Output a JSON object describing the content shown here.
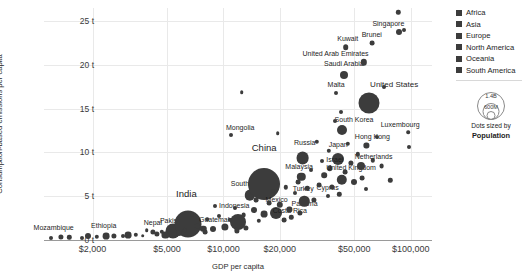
{
  "chart_data": {
    "type": "scatter",
    "title": "",
    "xlabel": "GDP per capita",
    "ylabel": "Consumption-based emissions per capita",
    "xscale": "log",
    "xlim": [
      1100,
      130000
    ],
    "ylim": [
      0,
      26.5
    ],
    "grid": true,
    "xticks": [
      {
        "value": 2000,
        "label": "$2,000"
      },
      {
        "value": 5000,
        "label": "$5,000"
      },
      {
        "value": 10000,
        "label": "$10,000"
      },
      {
        "value": 20000,
        "label": "$20,000"
      },
      {
        "value": 50000,
        "label": "$50,000"
      },
      {
        "value": 100000,
        "label": "$100,000"
      }
    ],
    "yticks": [
      {
        "value": 0,
        "label": "0 t"
      },
      {
        "value": 5,
        "label": "5 t"
      },
      {
        "value": 10,
        "label": "10 t"
      },
      {
        "value": 15,
        "label": "15 t"
      },
      {
        "value": 20,
        "label": "20 t"
      },
      {
        "value": 25,
        "label": "25 t"
      }
    ],
    "size_encoding": "Population",
    "legend_position": "right",
    "legend": {
      "title": "",
      "entries": [
        {
          "label": "Africa",
          "color": "#3c3c3c"
        },
        {
          "label": "Asia",
          "color": "#3c3c3c"
        },
        {
          "label": "Europe",
          "color": "#3c3c3c"
        },
        {
          "label": "North America",
          "color": "#3c3c3c"
        },
        {
          "label": "Oceania",
          "color": "#3c3c3c"
        },
        {
          "label": "South America",
          "color": "#3c3c3c"
        }
      ]
    },
    "size_legend": {
      "caption_line1": "Dots sized by",
      "caption_line2": "Population",
      "bubbles": [
        {
          "label": "1.4B",
          "diameter": 26
        },
        {
          "label": "600M",
          "diameter": 15
        },
        {
          "label": "",
          "diameter": 7
        }
      ]
    },
    "points": [
      {
        "name": "Mozambique",
        "x": 1350,
        "y": 0.35,
        "r": 2.6,
        "label": true,
        "lx": -7,
        "ly": -7
      },
      {
        "name": "Ethiopia",
        "x": 2350,
        "y": 0.45,
        "r": 3.4,
        "label": true,
        "lx": -2,
        "ly": -8
      },
      {
        "name": "Nepal",
        "x": 4200,
        "y": 0.9,
        "r": 2.6,
        "label": true,
        "lx": 0,
        "ly": -8
      },
      {
        "name": "Pakistan",
        "x": 5400,
        "y": 1.0,
        "r": 7.5,
        "label": true,
        "lx": 0,
        "ly": -4
      },
      {
        "name": "India",
        "x": 6500,
        "y": 1.85,
        "r": 13.5,
        "label": true,
        "lx": -2,
        "ly": -17,
        "size": "big"
      },
      {
        "name": "Guatemala",
        "x": 8800,
        "y": 1.25,
        "r": 3.0,
        "label": true,
        "lx": 3,
        "ly": -7
      },
      {
        "name": "Indonesia",
        "x": 12000,
        "y": 2.0,
        "r": 8.0,
        "label": true,
        "lx": -4,
        "ly": -9
      },
      {
        "name": "South Africa",
        "x": 13800,
        "y": 5.1,
        "r": 5.2,
        "label": true,
        "lx": 0,
        "ly": -7
      },
      {
        "name": "China",
        "x": 16500,
        "y": 6.4,
        "r": 16.0,
        "label": true,
        "lx": 0,
        "ly": -21,
        "size": "big"
      },
      {
        "name": "Mexico",
        "x": 19000,
        "y": 3.1,
        "r": 6.0,
        "label": true,
        "lx": 1,
        "ly": -8
      },
      {
        "name": "Costa Rica",
        "x": 21000,
        "y": 2.3,
        "r": 2.4,
        "label": true,
        "lx": 6,
        "ly": -7
      },
      {
        "name": "Panama",
        "x": 25500,
        "y": 3.1,
        "r": 2.6,
        "label": true,
        "lx": 5,
        "ly": -7
      },
      {
        "name": "Turkey",
        "x": 27000,
        "y": 4.4,
        "r": 5.2,
        "label": true,
        "lx": -1,
        "ly": -8
      },
      {
        "name": "Malaysia",
        "x": 26000,
        "y": 7.2,
        "r": 4.2,
        "label": true,
        "lx": -2,
        "ly": -7
      },
      {
        "name": "Russia",
        "x": 26500,
        "y": 9.4,
        "r": 6.4,
        "label": true,
        "lx": 2,
        "ly": -9
      },
      {
        "name": "Mongolia",
        "x": 11000,
        "y": 12.0,
        "r": 2.0,
        "label": true,
        "lx": 9,
        "ly": -6
      },
      {
        "name": "Japan",
        "x": 41000,
        "y": 9.3,
        "r": 6.0,
        "label": true,
        "lx": 0,
        "ly": -9
      },
      {
        "name": "Israel",
        "x": 37000,
        "y": 8.2,
        "r": 2.8,
        "label": true,
        "lx": 5,
        "ly": -6
      },
      {
        "name": "Cyprus",
        "x": 36000,
        "y": 5.0,
        "r": 2.0,
        "label": true,
        "lx": 0,
        "ly": -7
      },
      {
        "name": "United Kingdom",
        "x": 43000,
        "y": 6.9,
        "r": 5.2,
        "label": true,
        "lx": 9,
        "ly": -7
      },
      {
        "name": "Netherlands",
        "x": 54000,
        "y": 8.5,
        "r": 4.0,
        "label": true,
        "lx": 13,
        "ly": -6
      },
      {
        "name": "Hong Kong",
        "x": 58000,
        "y": 10.8,
        "r": 2.6,
        "label": true,
        "lx": 6,
        "ly": -7
      },
      {
        "name": "South Korea",
        "x": 43000,
        "y": 12.6,
        "r": 5.0,
        "label": true,
        "lx": 12,
        "ly": -6
      },
      {
        "name": "Luxembourg",
        "x": 97000,
        "y": 12.3,
        "r": 1.8,
        "label": true,
        "lx": -8,
        "ly": -7
      },
      {
        "name": "United States",
        "x": 60000,
        "y": 15.7,
        "r": 10.5,
        "label": true,
        "lx": 25,
        "ly": -8,
        "size": "mid"
      },
      {
        "name": "Malta",
        "x": 40000,
        "y": 16.8,
        "r": 2.0,
        "label": true,
        "lx": 0,
        "ly": -7
      },
      {
        "name": "Saudi Arabia",
        "x": 44000,
        "y": 18.9,
        "r": 4.0,
        "label": true,
        "lx": 0,
        "ly": -8
      },
      {
        "name": "United Arab Emirates",
        "x": 56000,
        "y": 20.3,
        "r": 3.2,
        "label": true,
        "lx": -28,
        "ly": -6
      },
      {
        "name": "Kuwait",
        "x": 45000,
        "y": 22.0,
        "r": 2.8,
        "label": true,
        "lx": 2,
        "ly": -7
      },
      {
        "name": "Brunei",
        "x": 62000,
        "y": 22.5,
        "r": 2.4,
        "label": true,
        "lx": 0,
        "ly": -7
      },
      {
        "name": "Singapore",
        "x": 87000,
        "y": 23.8,
        "r": 3.0,
        "label": true,
        "lx": -11,
        "ly": -6
      },
      {
        "name": "",
        "x": 1200,
        "y": 0.25,
        "r": 2.0,
        "label": false
      },
      {
        "name": "",
        "x": 1500,
        "y": 0.3,
        "r": 2.2,
        "label": false
      },
      {
        "name": "",
        "x": 1750,
        "y": 0.25,
        "r": 2.0,
        "label": false
      },
      {
        "name": "",
        "x": 1900,
        "y": 0.4,
        "r": 3.0,
        "label": false
      },
      {
        "name": "",
        "x": 2100,
        "y": 0.35,
        "r": 2.2,
        "label": false
      },
      {
        "name": "",
        "x": 2600,
        "y": 0.5,
        "r": 2.6,
        "label": false
      },
      {
        "name": "",
        "x": 2900,
        "y": 0.45,
        "r": 2.0,
        "label": false
      },
      {
        "name": "",
        "x": 3100,
        "y": 0.55,
        "r": 3.4,
        "label": false
      },
      {
        "name": "",
        "x": 3400,
        "y": 0.6,
        "r": 2.2,
        "label": false
      },
      {
        "name": "",
        "x": 3700,
        "y": 0.5,
        "r": 1.8,
        "label": false
      },
      {
        "name": "",
        "x": 3900,
        "y": 1.15,
        "r": 1.8,
        "label": false
      },
      {
        "name": "",
        "x": 4400,
        "y": 0.7,
        "r": 2.6,
        "label": false
      },
      {
        "name": "",
        "x": 4700,
        "y": 0.95,
        "r": 2.2,
        "label": false
      },
      {
        "name": "",
        "x": 4900,
        "y": 0.6,
        "r": 3.6,
        "label": false
      },
      {
        "name": "",
        "x": 5800,
        "y": 0.8,
        "r": 3.0,
        "label": false
      },
      {
        "name": "",
        "x": 6200,
        "y": 1.1,
        "r": 2.2,
        "label": false
      },
      {
        "name": "",
        "x": 7200,
        "y": 1.6,
        "r": 2.4,
        "label": false
      },
      {
        "name": "",
        "x": 7800,
        "y": 1.3,
        "r": 3.2,
        "label": false
      },
      {
        "name": "",
        "x": 8200,
        "y": 2.4,
        "r": 1.8,
        "label": false
      },
      {
        "name": "",
        "x": 9500,
        "y": 2.7,
        "r": 2.0,
        "label": false
      },
      {
        "name": "",
        "x": 10200,
        "y": 1.5,
        "r": 3.6,
        "label": false
      },
      {
        "name": "",
        "x": 10800,
        "y": 2.3,
        "r": 2.2,
        "label": false
      },
      {
        "name": "",
        "x": 11500,
        "y": 3.6,
        "r": 2.0,
        "label": false
      },
      {
        "name": "",
        "x": 12800,
        "y": 2.8,
        "r": 2.4,
        "label": false
      },
      {
        "name": "",
        "x": 13200,
        "y": 1.4,
        "r": 2.6,
        "label": false
      },
      {
        "name": "",
        "x": 14500,
        "y": 3.4,
        "r": 3.0,
        "label": false
      },
      {
        "name": "",
        "x": 15500,
        "y": 2.2,
        "r": 2.2,
        "label": false
      },
      {
        "name": "",
        "x": 17500,
        "y": 4.2,
        "r": 2.4,
        "label": false
      },
      {
        "name": "",
        "x": 18500,
        "y": 5.6,
        "r": 2.0,
        "label": false
      },
      {
        "name": "",
        "x": 20000,
        "y": 4.0,
        "r": 3.2,
        "label": false
      },
      {
        "name": "",
        "x": 21500,
        "y": 6.0,
        "r": 2.2,
        "label": false
      },
      {
        "name": "",
        "x": 22500,
        "y": 3.5,
        "r": 2.6,
        "label": false
      },
      {
        "name": "",
        "x": 24000,
        "y": 5.4,
        "r": 2.0,
        "label": false
      },
      {
        "name": "",
        "x": 25000,
        "y": 6.6,
        "r": 2.4,
        "label": false
      },
      {
        "name": "",
        "x": 28000,
        "y": 5.9,
        "r": 2.2,
        "label": false
      },
      {
        "name": "",
        "x": 29500,
        "y": 8.0,
        "r": 2.0,
        "label": false
      },
      {
        "name": "",
        "x": 30500,
        "y": 4.6,
        "r": 2.6,
        "label": false
      },
      {
        "name": "",
        "x": 31500,
        "y": 11.2,
        "r": 2.2,
        "label": false
      },
      {
        "name": "",
        "x": 32500,
        "y": 6.3,
        "r": 2.4,
        "label": false
      },
      {
        "name": "",
        "x": 33500,
        "y": 9.0,
        "r": 2.0,
        "label": false
      },
      {
        "name": "",
        "x": 34500,
        "y": 7.4,
        "r": 2.8,
        "label": false
      },
      {
        "name": "",
        "x": 36500,
        "y": 10.2,
        "r": 2.2,
        "label": false
      },
      {
        "name": "",
        "x": 38000,
        "y": 6.1,
        "r": 2.6,
        "label": false
      },
      {
        "name": "",
        "x": 39500,
        "y": 13.6,
        "r": 2.0,
        "label": false
      },
      {
        "name": "",
        "x": 41500,
        "y": 5.2,
        "r": 2.2,
        "label": false
      },
      {
        "name": "",
        "x": 42500,
        "y": 14.6,
        "r": 2.0,
        "label": false
      },
      {
        "name": "",
        "x": 44500,
        "y": 7.8,
        "r": 2.4,
        "label": false
      },
      {
        "name": "",
        "x": 46000,
        "y": 11.0,
        "r": 2.2,
        "label": false
      },
      {
        "name": "",
        "x": 48000,
        "y": 8.8,
        "r": 2.6,
        "label": false
      },
      {
        "name": "",
        "x": 50000,
        "y": 6.6,
        "r": 3.0,
        "label": false
      },
      {
        "name": "",
        "x": 52000,
        "y": 9.8,
        "r": 2.2,
        "label": false
      },
      {
        "name": "",
        "x": 55000,
        "y": 7.1,
        "r": 2.4,
        "label": false
      },
      {
        "name": "",
        "x": 58000,
        "y": 5.8,
        "r": 2.0,
        "label": false
      },
      {
        "name": "",
        "x": 63000,
        "y": 9.1,
        "r": 2.2,
        "label": false
      },
      {
        "name": "",
        "x": 66000,
        "y": 11.8,
        "r": 2.0,
        "label": false
      },
      {
        "name": "",
        "x": 70000,
        "y": 8.4,
        "r": 2.4,
        "label": false
      },
      {
        "name": "",
        "x": 72000,
        "y": 17.5,
        "r": 2.0,
        "label": false
      },
      {
        "name": "",
        "x": 78000,
        "y": 6.8,
        "r": 2.2,
        "label": false
      },
      {
        "name": "",
        "x": 86000,
        "y": 26.0,
        "r": 2.2,
        "label": false
      },
      {
        "name": "",
        "x": 92000,
        "y": 24.0,
        "r": 2.0,
        "label": false
      },
      {
        "name": "",
        "x": 98000,
        "y": 10.6,
        "r": 2.0,
        "label": false
      },
      {
        "name": "",
        "x": 12500,
        "y": 16.9,
        "r": 1.8,
        "label": false
      },
      {
        "name": "",
        "x": 19500,
        "y": 12.2,
        "r": 1.8,
        "label": false
      },
      {
        "name": "",
        "x": 6800,
        "y": 2.9,
        "r": 2.0,
        "label": false
      },
      {
        "name": "",
        "x": 9000,
        "y": 3.9,
        "r": 2.0,
        "label": false
      },
      {
        "name": "",
        "x": 15000,
        "y": 4.6,
        "r": 2.4,
        "label": false
      },
      {
        "name": "",
        "x": 16500,
        "y": 3.0,
        "r": 3.4,
        "label": false
      },
      {
        "name": "",
        "x": 23000,
        "y": 2.6,
        "r": 2.2,
        "label": false
      },
      {
        "name": "",
        "x": 11800,
        "y": 1.1,
        "r": 2.6,
        "label": false
      },
      {
        "name": "",
        "x": 8000,
        "y": 0.9,
        "r": 2.4,
        "label": false
      }
    ]
  }
}
